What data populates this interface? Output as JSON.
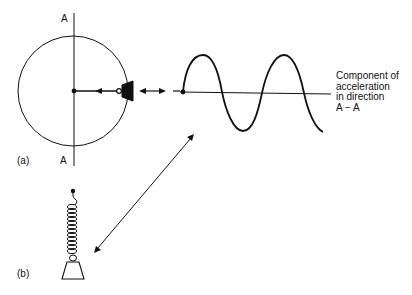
{
  "figure": {
    "part_a": {
      "label": "(a)",
      "axis_top_label": "A",
      "axis_bottom_label": "A",
      "circle": {
        "cx": 73,
        "cy": 91,
        "r": 55
      }
    },
    "part_b": {
      "label": "(b)"
    },
    "wave": {
      "caption_lines": [
        "Component of",
        "acceleration",
        "in direction",
        "A − A"
      ]
    },
    "colors": {
      "ink": "#111111",
      "background": "#ffffff"
    }
  }
}
